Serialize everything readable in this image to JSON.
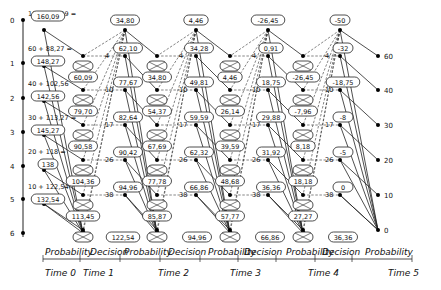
{
  "diagram": {
    "type": "multi-stage decision / probability network (inventory-style dynamic programming)",
    "y_axis": {
      "ticks": [
        "0",
        "1",
        "2",
        "3",
        "4",
        "5",
        "6"
      ]
    },
    "right_axis": {
      "ticks": [
        "60",
        "40",
        "30",
        "20",
        "10",
        "0"
      ]
    },
    "phases": [
      "Probability",
      "Decision",
      "Probability",
      "Decision",
      "Probability",
      "Decision",
      "Probability",
      "Decision",
      "Probability"
    ],
    "times": [
      "Time 0",
      "Time 1",
      "Time 2",
      "Time 3",
      "Time 4",
      "Time 5"
    ],
    "stage0_labels": [
      {
        "expr": "100 + 60,09 =",
        "value": "160,09"
      },
      {
        "expr": "60 + 88,27 =",
        "value": "148,27"
      },
      {
        "expr": "40 + 102,56",
        "value": "142,56",
        "prefix": "="
      },
      {
        "expr": "30 + 113,27 =",
        "value": "145,27"
      },
      {
        "expr": "20 + 118 =",
        "value": "138"
      },
      {
        "expr": "10 + 122,54",
        "value": "132,54",
        "prefix": "="
      }
    ],
    "top_values": [
      "34,80",
      "4,46",
      "-26,45",
      "-50"
    ],
    "stage1_prob_values": [
      "60,09",
      "79,70",
      "90,58",
      "104,36",
      "113,45",
      "122,54"
    ],
    "stage1_crossed": [
      "26+34",
      "37+43",
      "53+48",
      "74+30",
      "86+34",
      "100+22"
    ],
    "stage1_decision_values": [
      "62,10",
      "77,67",
      "82,64",
      "90,42",
      "94,96"
    ],
    "stage2_prob_values": [
      "34,80",
      "54,37",
      "67,69",
      "77,78",
      "85,87",
      "94,96"
    ],
    "stage2_decision_values": [
      "34,28",
      "49,81",
      "59,59",
      "62,32",
      "66,86"
    ],
    "stage3_prob_values": [
      "4,46",
      "26,14",
      "39,59",
      "48,68",
      "57,77",
      "66,86"
    ],
    "stage3_decision_values": [
      "0,91",
      "18,75",
      "29,88",
      "31,92",
      "36,36"
    ],
    "stage4_prob_values": [
      "-26,45",
      "-7,96",
      "8,18",
      "18,18",
      "27,27",
      "36,36"
    ],
    "stage4_decision_values": [
      "-32",
      "-18,75",
      "-8",
      "-5",
      "0"
    ],
    "decision_costs": [
      "4",
      "10",
      "17",
      "26",
      "38"
    ],
    "fan_costs": [
      "40",
      "50",
      "60",
      "70",
      "80",
      "90",
      "100"
    ],
    "prob_labels": [
      "1",
      "4,5",
      "5,8",
      "2,5",
      "3,8",
      "1,5",
      "1,2"
    ]
  }
}
